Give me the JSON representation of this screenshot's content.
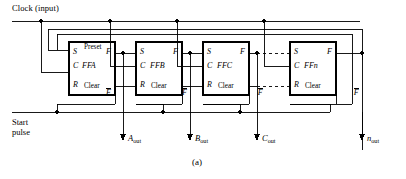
{
  "figure": {
    "caption": "(a)",
    "type": "digital-logic-schematic"
  },
  "labels": {
    "clock": "Clock  (input)",
    "start_line1": "Start",
    "start_line2": "pulse"
  },
  "flipflops": [
    {
      "id": "ffa",
      "name": "FFA",
      "preset_label": "Preset",
      "clear_label": "Clear",
      "pin_s": "S",
      "pin_c": "C",
      "pin_r": "R",
      "out_f": "F",
      "out_fbar": "F",
      "show_preset": true,
      "box": {
        "x": 69,
        "y": 42,
        "w": 46,
        "h": 53
      }
    },
    {
      "id": "ffb",
      "name": "FFB",
      "preset_label": "",
      "clear_label": "Clear",
      "pin_s": "S",
      "pin_c": "C",
      "pin_r": "R",
      "out_f": "F",
      "out_fbar": "F",
      "show_preset": false,
      "box": {
        "x": 136,
        "y": 42,
        "w": 46,
        "h": 53
      }
    },
    {
      "id": "ffc",
      "name": "FFC",
      "preset_label": "",
      "clear_label": "Clear",
      "pin_s": "S",
      "pin_c": "C",
      "pin_r": "R",
      "out_f": "F",
      "out_fbar": "F",
      "show_preset": false,
      "box": {
        "x": 203,
        "y": 42,
        "w": 46,
        "h": 53
      }
    },
    {
      "id": "ffn",
      "name": "FFn",
      "preset_label": "",
      "clear_label": "Clear",
      "pin_s": "S",
      "pin_c": "C",
      "pin_r": "R",
      "out_f": "F",
      "out_fbar": "F",
      "show_preset": false,
      "box": {
        "x": 290,
        "y": 42,
        "w": 46,
        "h": 53
      }
    }
  ],
  "outputs": [
    {
      "id": "a-out",
      "letter": "A",
      "sub": "out"
    },
    {
      "id": "b-out",
      "letter": "B",
      "sub": "out"
    },
    {
      "id": "c-out",
      "letter": "C",
      "sub": "out"
    },
    {
      "id": "n-out",
      "letter": "n",
      "sub": "out"
    }
  ],
  "colors": {
    "line": "#000000",
    "background": "#ffffff",
    "text": "#000000"
  }
}
